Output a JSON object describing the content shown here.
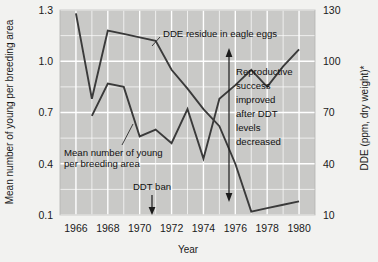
{
  "chart_data": {
    "type": "line",
    "title": "",
    "subtitle": "",
    "xlabel": "Year",
    "ylabel": "Mean number of young per breeding area",
    "ylabel_right": "DDE (ppm, dry weight)*",
    "xlim": [
      1965,
      1981
    ],
    "ylim": [
      0.1,
      1.3
    ],
    "ylim_right": [
      10,
      130
    ],
    "yticks": [
      0.1,
      0.4,
      0.7,
      1.0,
      1.3
    ],
    "ytick_labels": [
      "0.1",
      "0.4",
      "0.7",
      "1.0",
      "1.3"
    ],
    "yticks_right": [
      10,
      40,
      70,
      100,
      130
    ],
    "ytick_labels_right": [
      "10",
      "40",
      "70",
      "100",
      "130"
    ],
    "xticks": [
      1966,
      1968,
      1970,
      1972,
      1974,
      1976,
      1978,
      1980
    ],
    "xtick_labels": [
      "1966",
      "1968",
      "1970",
      "1972",
      "1974",
      "1976",
      "1978",
      "1980"
    ],
    "grid": true,
    "grid_color": "#ffffff",
    "plot_bg": "#c9c9c7",
    "page_bg": "#f2f2f0",
    "line_color": "#3a3a3a",
    "legend": "none",
    "series": [
      {
        "name": "DDE residue in eagle eggs",
        "axis": "right",
        "unit": "ppm, dry weight",
        "x": [
          1966,
          1967,
          1968,
          1969,
          1970,
          1971,
          1972,
          1973,
          1974,
          1975,
          1976,
          1977,
          1978,
          1979,
          1980
        ],
        "values": [
          128,
          78,
          118,
          116,
          114,
          112,
          95,
          84,
          72,
          62,
          40,
          12,
          14,
          16,
          18
        ]
      },
      {
        "name": "Mean number of young per breeding area",
        "axis": "left",
        "unit": "young per breeding area",
        "x": [
          1967,
          1968,
          1969,
          1970,
          1971,
          1972,
          1973,
          1974,
          1975,
          1976,
          1977,
          1978,
          1979,
          1980
        ],
        "values": [
          0.68,
          0.87,
          0.85,
          0.56,
          0.6,
          0.52,
          0.72,
          0.43,
          0.78,
          0.86,
          0.95,
          0.85,
          0.97,
          1.07
        ]
      }
    ],
    "annotations": [
      {
        "id": "dde-label",
        "text": "DDE residue in eagle eggs",
        "x": 1971.0,
        "y_right": 122
      },
      {
        "id": "young-label",
        "text": "Mean number of young\nper breeding area",
        "x": 1968.6,
        "y_left": 0.37
      },
      {
        "id": "ddt-ban",
        "text": "DDT ban",
        "x": 1972.6,
        "y_left": 0.15,
        "marker": "down-arrow"
      },
      {
        "id": "repro-note",
        "text": "Reproductive\nsuccess\nimproved\nafter DDT\nlevels\ndecreased",
        "x": 1977.6,
        "y_left": 0.7,
        "marker": "double-arrow"
      }
    ]
  },
  "labels": {
    "y_left_title": "Mean number of young per breeding area",
    "y_right_title": "DDE (ppm, dry weight)*",
    "x_title": "Year",
    "y_left": [
      "1.3",
      "1.0",
      "0.7",
      "0.4",
      "0.1"
    ],
    "y_right": [
      "130",
      "100",
      "70",
      "40",
      "10"
    ],
    "x": [
      "1966",
      "1968",
      "1970",
      "1972",
      "1974",
      "1976",
      "1978",
      "1980"
    ],
    "ann_dde": "DDE residue in eagle eggs",
    "ann_young_l1": "Mean number of young",
    "ann_young_l2": "per breeding area",
    "ann_ddt_ban": "DDT ban",
    "ann_repro_l1": "Reproductive",
    "ann_repro_l2": "success",
    "ann_repro_l3": "improved",
    "ann_repro_l4": "after DDT",
    "ann_repro_l5": "levels",
    "ann_repro_l6": "decreased"
  }
}
